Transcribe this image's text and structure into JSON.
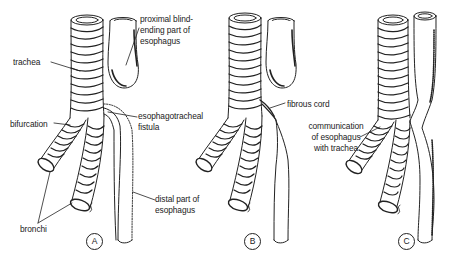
{
  "figure": {
    "type": "anatomical-illustration"
  },
  "panels": [
    {
      "id": "A",
      "letter": "A",
      "labels": {
        "trachea": "trachea",
        "proximal": "proximal blind-\nending part of\nesophagus",
        "bifurcation": "bifurcation",
        "fistula": "esophagotracheal\nfistula",
        "bronchi": "bronchi",
        "distal": "distal part of\nesophagus"
      }
    },
    {
      "id": "B",
      "letter": "B",
      "labels": {
        "fibrous_cord": "fibrous cord"
      }
    },
    {
      "id": "C",
      "letter": "C",
      "labels": {
        "communication": "communication\nof esophagus\nwith trachea"
      }
    }
  ],
  "colors": {
    "ink": "#222222",
    "background": "#ffffff"
  }
}
